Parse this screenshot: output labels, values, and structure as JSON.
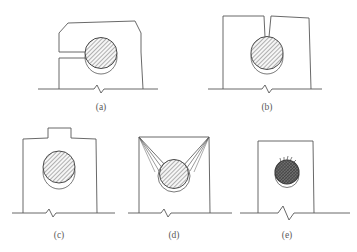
{
  "figure": {
    "header_note": "",
    "background_color": "#ffffff",
    "line_color": "#585858",
    "caption_color": "#5a5a5a",
    "nugget_hatch_color": "#6e6e6e",
    "nugget_fill_color": "#f2f2f2",
    "dark_nugget_fill_color": "#6f6f6f",
    "panels": [
      {
        "id": "a",
        "caption": "(a)",
        "defect_name": "edge-notch-and-distorted-sheet",
        "body_shape": "irregular-polygon",
        "nugget_style": "hatched",
        "features": [
          "left-edge-slot-notch",
          "deformed-upper-surface",
          "break-line-base"
        ]
      },
      {
        "id": "b",
        "caption": "(b)",
        "defect_name": "surface-crack-to-nugget",
        "body_shape": "rectangle",
        "nugget_style": "hatched",
        "features": [
          "vertical-top-crack",
          "break-line-base"
        ]
      },
      {
        "id": "c",
        "caption": "(c)",
        "defect_name": "surface-expulsion-protrusion",
        "body_shape": "rectangle",
        "nugget_style": "hatched",
        "features": [
          "raised-rectangular-protrusion",
          "break-line-base"
        ]
      },
      {
        "id": "d",
        "caption": "(d)",
        "defect_name": "radiating-corner-cracks",
        "body_shape": "rectangle",
        "nugget_style": "hatched",
        "features": [
          "fan-cracks-from-top-corners",
          "break-line-base"
        ]
      },
      {
        "id": "e",
        "caption": "(e)",
        "defect_name": "small-dark-nugget-rough-surface",
        "body_shape": "rectangle",
        "nugget_style": "dark-dense-hatched",
        "features": [
          "rough-spiky-nugget-top",
          "break-line-base"
        ]
      }
    ]
  }
}
